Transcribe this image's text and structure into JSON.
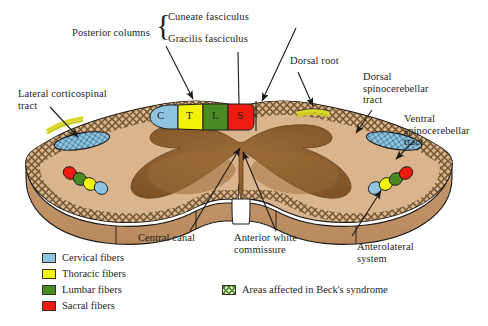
{
  "figure": {
    "background": "#ffffff"
  },
  "labels": {
    "posterior_columns": "Posterior columns",
    "cuneate_fasciculus": "Cuneate fasciculus",
    "gracilis_fasciculus": "Gracilis fasciculus",
    "dorsal_root": "Dorsal root",
    "dorsal_spinocerebellar_tract": "Dorsal\nspinocerebellar\ntract",
    "ventral_spinocerebellar_tract": "Ventral\nspinocerebellar\ntract",
    "lateral_corticospinal_tract": "Lateral corticospinal\ntract",
    "central_canal": "Central canal",
    "anterior_white_commissure": "Anterior white\ncommissure",
    "anterolateral_system": "Anterolateral\nsystem"
  },
  "segment_letters": {
    "cervical": "C",
    "thoracic": "T",
    "lumbar": "L",
    "sacral": "S"
  },
  "legend": {
    "items": [
      {
        "label": "Cervical fibers",
        "color": "#8ec4e0"
      },
      {
        "label": "Thoracic fibers",
        "color": "#f2f20a"
      },
      {
        "label": "Lumbar fibers",
        "color": "#4a8a23"
      },
      {
        "label": "Sacral fibers",
        "color": "#ee1b11"
      }
    ],
    "becks": {
      "label": "Areas affected in Beck's syndrome",
      "color": "#4a8a23",
      "pattern": "crosshatch"
    }
  },
  "colors": {
    "white_matter": "#c79a6e",
    "white_matter_light": "#d6b08a",
    "gray_matter": "#8b5e2f",
    "gray_matter_light": "#a6743e",
    "outline": "#1a1a1a",
    "cervical": "#8ec4e0",
    "thoracic": "#f2f20a",
    "lumbar": "#4a8a23",
    "sacral": "#ee1b11",
    "dorsal_root_band": "#d8d82a",
    "crosshatch": "#5a4326",
    "base_side": "#c79a6e"
  },
  "icons": {
    "brace_left": "{",
    "leader_arrow": "arrow-head"
  }
}
